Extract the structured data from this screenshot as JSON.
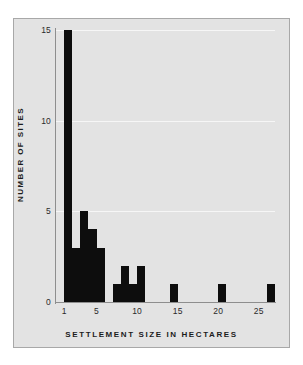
{
  "figure": {
    "background_color": "#ffffff",
    "panel_color": "#e3e3e3",
    "panel_border_color": "#a8a8a8",
    "bar_color": "#0d0d0d",
    "gridline_color": "#f6f6f6",
    "axis_color": "#8e8e8e"
  },
  "chart_data": {
    "type": "bar",
    "title": "",
    "subtitle": "",
    "xlabel": "SETTLEMENT SIZE IN HECTARES",
    "ylabel": "NUMBER OF SITES",
    "xlim": [
      0,
      27
    ],
    "ylim": [
      0,
      15
    ],
    "grid": true,
    "legend": null,
    "x_ticks": [
      1,
      5,
      10,
      15,
      20,
      25
    ],
    "x_tick_labels": [
      "1",
      "5",
      "10",
      "15",
      "20",
      "25"
    ],
    "y_ticks": [
      0,
      5,
      10,
      15
    ],
    "y_tick_labels": [
      "0",
      "5",
      "10",
      "15"
    ],
    "bin_width": 1,
    "categories": [
      1,
      2,
      3,
      4,
      5,
      6,
      7,
      8,
      9,
      10,
      11,
      12,
      13,
      14,
      15,
      16,
      17,
      18,
      19,
      20,
      21,
      22,
      23,
      24,
      25,
      26
    ],
    "values": [
      15,
      3,
      5,
      4,
      3,
      0,
      1,
      2,
      1,
      2,
      0,
      0,
      0,
      1,
      0,
      0,
      0,
      0,
      0,
      1,
      0,
      0,
      0,
      0,
      0,
      1
    ],
    "bars": [
      {
        "bin_start": 1,
        "bin_end": 2,
        "value": 15
      },
      {
        "bin_start": 2,
        "bin_end": 3,
        "value": 3
      },
      {
        "bin_start": 3,
        "bin_end": 4,
        "value": 5
      },
      {
        "bin_start": 4,
        "bin_end": 5,
        "value": 4
      },
      {
        "bin_start": 5,
        "bin_end": 6,
        "value": 3
      },
      {
        "bin_start": 7,
        "bin_end": 8,
        "value": 1
      },
      {
        "bin_start": 8,
        "bin_end": 9,
        "value": 2
      },
      {
        "bin_start": 9,
        "bin_end": 10,
        "value": 1
      },
      {
        "bin_start": 10,
        "bin_end": 11,
        "value": 2
      },
      {
        "bin_start": 14,
        "bin_end": 15,
        "value": 1
      },
      {
        "bin_start": 20,
        "bin_end": 21,
        "value": 1
      },
      {
        "bin_start": 26,
        "bin_end": 27,
        "value": 1
      }
    ]
  }
}
